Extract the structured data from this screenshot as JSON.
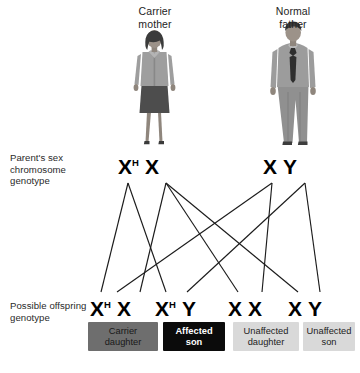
{
  "parents": {
    "mother": {
      "title": "Carrier\nmother",
      "title_line1": "Carrier",
      "title_line2": "mother",
      "genotype_allele1": "X",
      "genotype_allele1_sup": "H",
      "genotype_allele2": "X"
    },
    "father": {
      "title_line1": "Normal",
      "title_line2": "father",
      "genotype_allele1": "X",
      "genotype_allele2": "Y"
    }
  },
  "row_labels": {
    "parent": "Parent's sex chromosome genotype",
    "offspring": "Possible offspring genotype"
  },
  "offspring": [
    {
      "allele1": "X",
      "allele1_sup": "H",
      "allele2": "X",
      "outcome_line1": "Carrier",
      "outcome_line2": "daughter",
      "box_style": "dark-gray",
      "box_color": "#6e6e6e",
      "text_color": "#191919"
    },
    {
      "allele1": "X",
      "allele1_sup": "H",
      "allele2": "Y",
      "outcome_line1": "Affected",
      "outcome_line2": "son",
      "box_style": "black",
      "box_color": "#0b0b0b",
      "text_color": "#ffffff"
    },
    {
      "allele1": "X",
      "allele1_sup": "",
      "allele2": "X",
      "outcome_line1": "Unaffected",
      "outcome_line2": "daughter",
      "box_style": "light-gray",
      "box_color": "#d9d9d9",
      "text_color": "#222222"
    },
    {
      "allele1": "X",
      "allele1_sup": "",
      "allele2": "Y",
      "outcome_line1": "Unaffected",
      "outcome_line2": "son",
      "box_style": "light-gray",
      "box_color": "#d9d9d9",
      "text_color": "#222222"
    }
  ],
  "colors": {
    "background": "#ffffff",
    "line": "#1b1b1b",
    "figure_clothing_gray": "#9a9a9a",
    "figure_dark": "#4a4a4a",
    "figure_skin": "#9c9289"
  },
  "icons": {
    "mother": "female-figure-icon",
    "father": "male-figure-icon"
  }
}
